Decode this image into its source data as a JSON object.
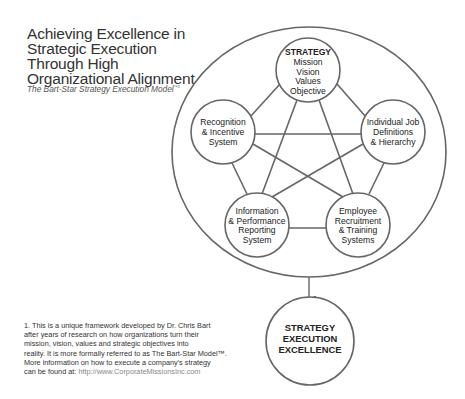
{
  "header": {
    "title_lines": [
      "Achieving Excellence in",
      "Strategic Execution",
      "Through High",
      "Organizational Alignment"
    ],
    "subtitle": "The Bart-Star Strategy Execution Model",
    "subtitle_mark": "™1"
  },
  "diagram": {
    "stroke_color": "#666666",
    "nodes": {
      "strategy": {
        "title": "STRATEGY",
        "lines": [
          "Mission",
          "Vision",
          "Values",
          "Objective"
        ]
      },
      "recognition": {
        "lines": [
          "Recognition",
          "& Incentive",
          "System"
        ]
      },
      "individual": {
        "lines": [
          "Individual Job",
          "Definitions",
          "& Hierarchy"
        ]
      },
      "information": {
        "lines": [
          "Information",
          "& Performance",
          "Reporting",
          "System"
        ]
      },
      "employee": {
        "lines": [
          "Employee",
          "Recruitment",
          "& Training",
          "Systems"
        ]
      },
      "outcome": {
        "lines": [
          "STRATEGY",
          "EXECUTION",
          "EXCELLENCE"
        ]
      }
    }
  },
  "footnote": {
    "lines": [
      "1. This is a unique framework developed by Dr. Chris Bart",
      "after years of research on how organizations turn their",
      "mission, vision, values and strategic objectives into",
      "reality. It is more formally referred to as The Bart-Star Model™.",
      "More information on how to execute a company's strategy"
    ],
    "last_prefix": "can be found at: ",
    "url": "http://www.CorporateMissionsInc.com"
  }
}
